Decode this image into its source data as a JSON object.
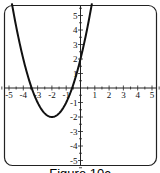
{
  "figure": {
    "caption": "Figure 10c"
  },
  "chart_data": {
    "type": "line",
    "title": "",
    "xlabel": "",
    "ylabel": "",
    "xlim": [
      -5.5,
      5.5
    ],
    "ylim": [
      -5.5,
      5.5
    ],
    "x_ticks": [
      -5,
      -4,
      -3,
      -2,
      -1,
      1,
      2,
      3,
      4,
      5
    ],
    "y_ticks": [
      -5,
      -4,
      -3,
      -2,
      -1,
      1,
      2,
      3,
      4,
      5
    ],
    "grid": false,
    "legend": null,
    "series": [
      {
        "name": "parabola",
        "equation": "y = x^2 + 4x + 2",
        "vertex": [
          -2,
          -2
        ],
        "y_intercept": 2,
        "x_intercepts": [
          -3.41,
          -0.59
        ],
        "x": [
          -4.8,
          -4.5,
          -4,
          -3.5,
          -3,
          -2.5,
          -2,
          -1.5,
          -1,
          -0.5,
          0,
          0.5,
          0.8
        ],
        "values": [
          5.84,
          4.25,
          2,
          0.25,
          -1,
          -1.75,
          -2,
          -1.75,
          -1,
          0.25,
          2,
          4.25,
          5.84
        ]
      }
    ]
  }
}
